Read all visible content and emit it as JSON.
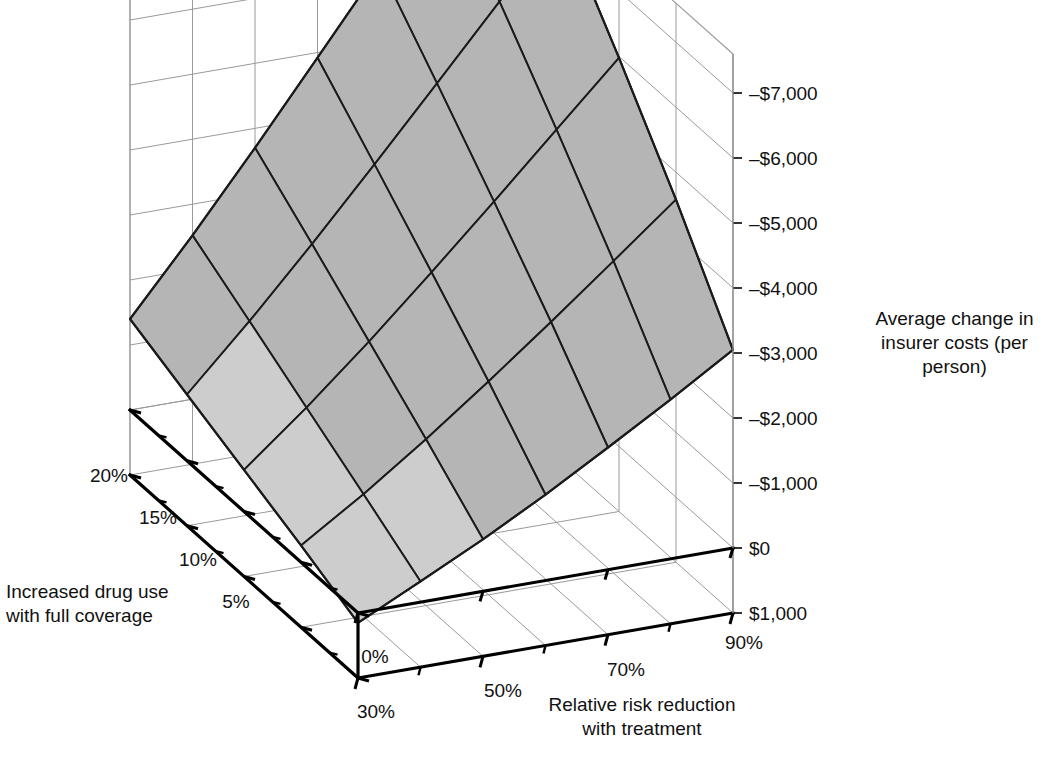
{
  "figure": {
    "background": "#ffffff",
    "surface_fill": "#b5b5b5",
    "surface_fill_low": "#cdcdcd",
    "mesh_color": "#1a1a1a",
    "wall_grid_color": "#9a9a9a",
    "axis_color": "#000000"
  },
  "axes": {
    "z": {
      "title_lines": [
        "Average change in",
        "insurer costs (per",
        "person)"
      ],
      "ticks": [
        "–$7,000",
        "–$6,000",
        "–$5,000",
        "–$4,000",
        "–$3,000",
        "–$2,000",
        "–$1,000",
        "$0",
        "$1,000"
      ],
      "values": [
        -7000,
        -6000,
        -5000,
        -4000,
        -3000,
        -2000,
        -1000,
        0,
        1000
      ]
    },
    "x": {
      "title_lines": [
        "Relative risk reduction",
        "with treatment"
      ],
      "ticks": [
        "30%",
        "50%",
        "70%",
        "90%"
      ],
      "values": [
        30,
        50,
        70,
        90
      ]
    },
    "y": {
      "title_lines": [
        "Increased drug use",
        "with full coverage"
      ],
      "ticks": [
        "0%",
        "5%",
        "10%",
        "15%",
        "20%"
      ],
      "values": [
        0,
        5,
        10,
        15,
        20
      ]
    }
  },
  "chart_data": {
    "type": "surface",
    "title": "",
    "xlabel": "Relative risk reduction with treatment",
    "ylabel": "Increased drug use with full coverage",
    "zlabel": "Average change in insurer costs (per person)",
    "x": [
      30,
      40,
      50,
      60,
      70,
      80,
      90
    ],
    "y": [
      0,
      5,
      10,
      15,
      20
    ],
    "xlim": [
      30,
      90
    ],
    "ylim": [
      0,
      20
    ],
    "zlim": [
      1000,
      -7600
    ],
    "grid": true,
    "legend": "none",
    "z_note": "Average change in insurer costs per person; negative = savings",
    "z": [
      [
        150,
        -320,
        -800,
        -1320,
        -1880,
        -2450,
        -3050
      ],
      [
        -260,
        -880,
        -1560,
        -2280,
        -3030,
        -3800,
        -4580
      ],
      [
        -640,
        -1430,
        -2280,
        -3180,
        -4100,
        -5040,
        -5980
      ],
      [
        -1020,
        -1980,
        -3000,
        -4060,
        -5140,
        -6230,
        -7300
      ],
      [
        -1400,
        -2520,
        -3700,
        -4920,
        -6150,
        -7400,
        -8600
      ]
    ]
  }
}
